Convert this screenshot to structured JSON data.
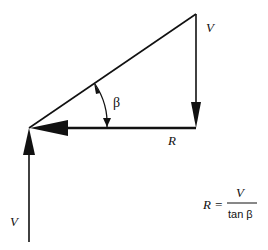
{
  "diagram": {
    "type": "velocity-vector-triangle",
    "labels": {
      "v_top": "V",
      "v_bottom": "V",
      "r_horizontal": "R",
      "angle": "β"
    },
    "formula": {
      "lhs": "R =",
      "numerator": "V",
      "denominator": "tan β"
    },
    "colors": {
      "stroke": "#111111",
      "background": "#ffffff"
    }
  }
}
